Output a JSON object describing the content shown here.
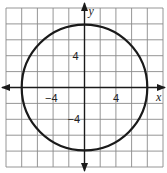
{
  "chart_data": {
    "type": "scatter",
    "title": "",
    "xlabel": "x",
    "ylabel": "y",
    "xlim": [
      -10,
      10
    ],
    "ylim": [
      -10,
      10
    ],
    "grid": true,
    "grid_step": 2,
    "tick_labels": {
      "x": [
        {
          "value": -4,
          "label": "−4"
        },
        {
          "value": 4,
          "label": "4"
        }
      ],
      "y": [
        {
          "value": 4,
          "label": "4"
        },
        {
          "value": -4,
          "label": "−4"
        }
      ]
    },
    "circle": {
      "center": [
        0,
        0
      ],
      "radius": 8
    }
  },
  "axes": {
    "x_name": "x",
    "y_name": "y",
    "x_neg4": "−4",
    "x_pos4": "4",
    "y_pos4": "4",
    "y_neg4": "−4"
  }
}
